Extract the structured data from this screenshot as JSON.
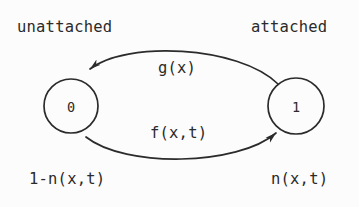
{
  "figure": {
    "kind": "two-state-transition-diagram",
    "background_color": "#fcfcfc",
    "ink_color": "#2b2b2b"
  },
  "states": [
    {
      "id": "state-0",
      "node_label": "0",
      "caption": "unattached",
      "occupancy": "1-n(x,t)",
      "cx": 71,
      "cy": 106,
      "r": 27
    },
    {
      "id": "state-1",
      "node_label": "1",
      "caption": "attached",
      "occupancy": "n(x,t)",
      "cx": 296,
      "cy": 106,
      "r": 28
    }
  ],
  "transitions": [
    {
      "id": "transition-detach",
      "label": "g(x)",
      "from": "state-1",
      "to": "state-0",
      "direction": "right-to-left",
      "arc_position": "top"
    },
    {
      "id": "transition-attach",
      "label": "f(x,t)",
      "from": "state-0",
      "to": "state-1",
      "direction": "left-to-right",
      "arc_position": "bottom"
    }
  ]
}
